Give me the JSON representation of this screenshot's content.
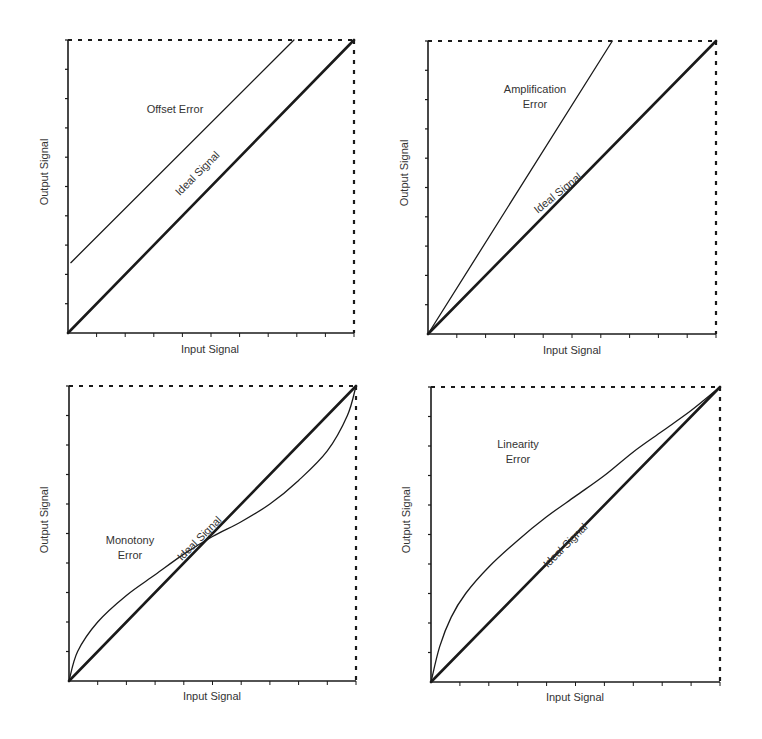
{
  "colors": {
    "ink": "#1a1a1a",
    "label": "#333333",
    "background": "#ffffff"
  },
  "chart_data": [
    {
      "type": "line",
      "title": "",
      "xlabel": "Input Signal",
      "ylabel": "Output Signal",
      "xlim": [
        0,
        1
      ],
      "ylim": [
        0,
        1
      ],
      "ticks": {
        "x_count": 10,
        "y_count": 10,
        "labels": false
      },
      "grid": false,
      "frame": "dashed top and right border",
      "series": [
        {
          "name": "Ideal Signal",
          "style": "thick",
          "x": [
            0,
            1
          ],
          "y": [
            0,
            1
          ],
          "label": "Ideal Signal"
        },
        {
          "name": "Offset Error",
          "style": "thin",
          "x": [
            0.01,
            0.79
          ],
          "y": [
            0.24,
            1.0
          ],
          "label": "Offset Error"
        }
      ],
      "annotations": [
        {
          "text": "Offset Error",
          "x": 0.37,
          "y": 0.75
        },
        {
          "text": "Ideal Signal",
          "x": 0.47,
          "y": 0.46,
          "rotation": -45
        }
      ]
    },
    {
      "type": "line",
      "title": "",
      "xlabel": "Input Signal",
      "ylabel": "Output Signal",
      "xlim": [
        0,
        1
      ],
      "ylim": [
        0,
        1
      ],
      "ticks": {
        "x_count": 10,
        "y_count": 10,
        "labels": false
      },
      "grid": false,
      "frame": "dashed top and right border",
      "series": [
        {
          "name": "Ideal Signal",
          "style": "thick",
          "x": [
            0,
            1
          ],
          "y": [
            0,
            1
          ],
          "label": "Ideal Signal"
        },
        {
          "name": "Amplification Error",
          "style": "thin",
          "x": [
            0,
            0.64
          ],
          "y": [
            0,
            1.0
          ],
          "label": "Amplification Error"
        }
      ],
      "annotations": [
        {
          "text": "Amplification",
          "x": 0.38,
          "y": 0.83
        },
        {
          "text": "Error",
          "x": 0.38,
          "y": 0.77
        },
        {
          "text": "Ideal Signal",
          "x": 0.47,
          "y": 0.46,
          "rotation": -45
        }
      ]
    },
    {
      "type": "line",
      "title": "",
      "xlabel": "Input Signal",
      "ylabel": "Output Signal",
      "xlim": [
        0,
        1
      ],
      "ylim": [
        0,
        1
      ],
      "ticks": {
        "x_count": 10,
        "y_count": 10,
        "labels": false
      },
      "grid": false,
      "frame": "dashed top and right border",
      "series": [
        {
          "name": "Ideal Signal",
          "style": "thick",
          "x": [
            0,
            1
          ],
          "y": [
            0,
            1
          ],
          "label": "Ideal Signal"
        },
        {
          "name": "Monotony Error",
          "style": "thin",
          "x": [
            0,
            0.03,
            0.1,
            0.2,
            0.3,
            0.4,
            0.5,
            0.6,
            0.7,
            0.8,
            0.9,
            0.97,
            1.0
          ],
          "y": [
            0,
            0.1,
            0.2,
            0.29,
            0.36,
            0.43,
            0.49,
            0.54,
            0.6,
            0.68,
            0.78,
            0.9,
            1.0
          ],
          "label": "Monotony Error"
        }
      ],
      "annotations": [
        {
          "text": "Monotony",
          "x": 0.21,
          "y": 0.48
        },
        {
          "text": "Error",
          "x": 0.21,
          "y": 0.43
        },
        {
          "text": "Ideal Signal",
          "x": 0.47,
          "y": 0.43,
          "rotation": -45
        }
      ]
    },
    {
      "type": "line",
      "title": "",
      "xlabel": "Input Signal",
      "ylabel": "Output Signal",
      "xlim": [
        0,
        1
      ],
      "ylim": [
        0,
        1
      ],
      "ticks": {
        "x_count": 10,
        "y_count": 10,
        "labels": false
      },
      "grid": false,
      "frame": "dashed top and right border",
      "series": [
        {
          "name": "Ideal Signal",
          "style": "thick",
          "x": [
            0,
            1
          ],
          "y": [
            0,
            1
          ],
          "label": "Ideal Signal"
        },
        {
          "name": "Linearity Error",
          "style": "thin",
          "x": [
            0,
            0.03,
            0.07,
            0.12,
            0.2,
            0.3,
            0.4,
            0.5,
            0.6,
            0.7,
            0.8,
            0.9,
            1.0
          ],
          "y": [
            0,
            0.12,
            0.22,
            0.3,
            0.39,
            0.48,
            0.56,
            0.63,
            0.7,
            0.78,
            0.85,
            0.92,
            1.0
          ],
          "label": "Linearity Error"
        }
      ],
      "annotations": [
        {
          "text": "Linearity",
          "x": 0.25,
          "y": 0.82
        },
        {
          "text": "Error",
          "x": 0.25,
          "y": 0.76
        },
        {
          "text": "Ideal Signal",
          "x": 0.47,
          "y": 0.43,
          "rotation": -45
        }
      ]
    }
  ],
  "panels": [
    {
      "id": "offset",
      "label_lines": [
        "Offset Error"
      ],
      "ideal_label": "Ideal Signal",
      "xlabel": "Input Signal",
      "ylabel": "Output Signal"
    },
    {
      "id": "amplification",
      "label_lines": [
        "Amplification",
        "Error"
      ],
      "ideal_label": "Ideal Signal",
      "xlabel": "Input Signal",
      "ylabel": "Output Signal"
    },
    {
      "id": "monotony",
      "label_lines": [
        "Monotony",
        "Error"
      ],
      "ideal_label": "Ideal Signal",
      "xlabel": "Input Signal",
      "ylabel": "Output Signal"
    },
    {
      "id": "linearity",
      "label_lines": [
        "Linearity",
        "Error"
      ],
      "ideal_label": "Ideal Signal",
      "xlabel": "Input Signal",
      "ylabel": "Output Signal"
    }
  ]
}
